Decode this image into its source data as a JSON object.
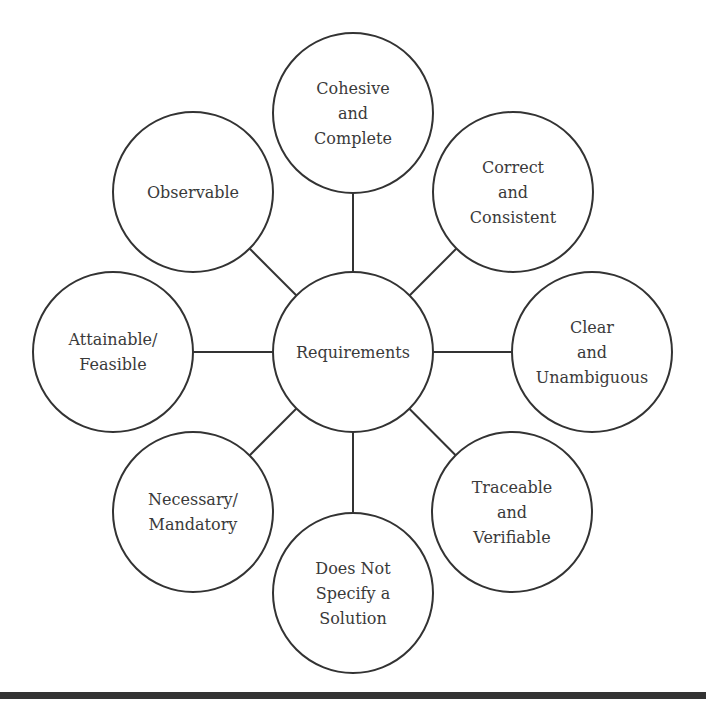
{
  "diagram": {
    "center": {
      "label_lines": [
        "Requirements"
      ],
      "cx": 353,
      "cy": 352,
      "r": 80
    },
    "nodes": [
      {
        "id": "cohesive-complete",
        "label_lines": [
          "Cohesive",
          "and",
          "Complete"
        ],
        "cx": 353,
        "cy": 113,
        "r": 80
      },
      {
        "id": "correct-consistent",
        "label_lines": [
          "Correct",
          "and",
          "Consistent"
        ],
        "cx": 513,
        "cy": 192,
        "r": 80
      },
      {
        "id": "clear-unambiguous",
        "label_lines": [
          "Clear",
          "and",
          "Unambiguous"
        ],
        "cx": 592,
        "cy": 352,
        "r": 80
      },
      {
        "id": "traceable-verifiable",
        "label_lines": [
          "Traceable",
          "and",
          "Verifiable"
        ],
        "cx": 512,
        "cy": 512,
        "r": 80
      },
      {
        "id": "does-not-specify-solution",
        "label_lines": [
          "Does Not",
          "Specify a",
          "Solution"
        ],
        "cx": 353,
        "cy": 593,
        "r": 80
      },
      {
        "id": "necessary-mandatory",
        "label_lines": [
          "Necessary/",
          "Mandatory"
        ],
        "cx": 193,
        "cy": 512,
        "r": 80
      },
      {
        "id": "attainable-feasible",
        "label_lines": [
          "Attainable/",
          "Feasible"
        ],
        "cx": 113,
        "cy": 352,
        "r": 80
      },
      {
        "id": "observable",
        "label_lines": [
          "Observable"
        ],
        "cx": 193,
        "cy": 192,
        "r": 80
      }
    ],
    "colors": {
      "stroke": "#333333",
      "text": "#3a3a3a",
      "fill": "#ffffff"
    }
  }
}
